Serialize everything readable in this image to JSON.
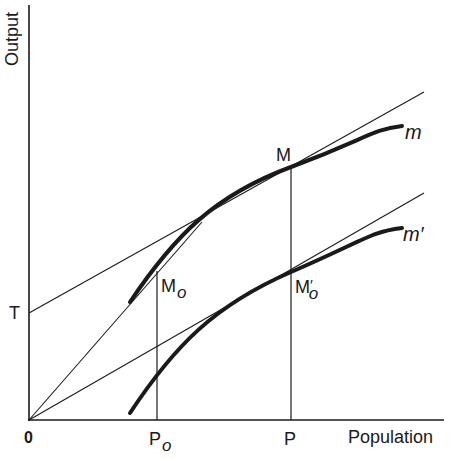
{
  "figure": {
    "axes": {
      "y_label": "Output",
      "x_label": "Population",
      "origin_label": "0"
    },
    "labels": {
      "T": "T",
      "P0_main": "P",
      "P0_sub": "o",
      "P": "P",
      "M": "M",
      "M0_main": "M",
      "M0_sub": "o",
      "M0prime_main": "M",
      "M0prime_prime": "′",
      "M0prime_sub": "o",
      "curve_m": "m",
      "curve_m_prime": "m′"
    },
    "colors": {
      "ink": "#1a1a1a",
      "background": "#ffffff"
    },
    "elements": {
      "curves": [
        {
          "name": "m",
          "description": "upper production curve, thick, concave"
        },
        {
          "name": "m′",
          "description": "lower production curve, thick, concave"
        }
      ],
      "lines": [
        {
          "name": "tangent-from-T",
          "description": "tangent to m at M, intercept T on Output axis"
        },
        {
          "name": "ray-to-M0",
          "description": "ray from origin tangent to m at M0"
        },
        {
          "name": "ray-to-M0prime",
          "description": "ray from origin through M′o, parallel to tangent at M"
        },
        {
          "name": "vertical-P0",
          "description": "vertical from P0 up to M0"
        },
        {
          "name": "vertical-P",
          "description": "vertical from P up to M"
        }
      ]
    }
  }
}
